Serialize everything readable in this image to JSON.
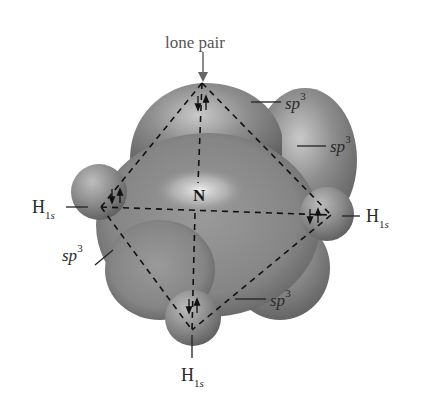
{
  "figure": {
    "center_atom": "N",
    "lone_pair_label": "lone pair",
    "hybrid_label": {
      "base": "sp",
      "exp": "3"
    },
    "hydrogen_label": {
      "base": "H",
      "sub_num": "1",
      "sub_letter": "s"
    },
    "sp3_labels": [
      {
        "id": "top-right",
        "base": "sp",
        "exp": "3"
      },
      {
        "id": "right",
        "base": "sp",
        "exp": "3"
      },
      {
        "id": "left",
        "base": "sp",
        "exp": "3"
      },
      {
        "id": "bottom",
        "base": "sp",
        "exp": "3"
      }
    ],
    "h1s_labels": [
      {
        "id": "left",
        "base": "H",
        "sub_num": "1",
        "sub_letter": "s"
      },
      {
        "id": "right",
        "base": "H",
        "sub_num": "1",
        "sub_letter": "s"
      },
      {
        "id": "bottom",
        "base": "H",
        "sub_num": "1",
        "sub_letter": "s"
      }
    ],
    "electron_pair_symbol": "↓↑",
    "colors": {
      "lobe": "#8a8a8a",
      "lobe_highlight": "#d8d8d8",
      "lobe_shadow": "#5a5a5a",
      "dash": "#111111",
      "text": "#2a2a2a",
      "arrow": "#666666"
    }
  }
}
